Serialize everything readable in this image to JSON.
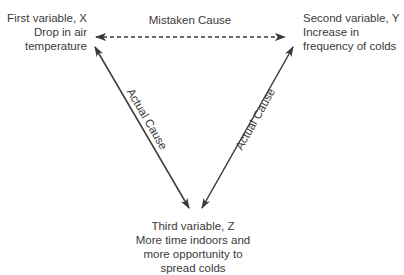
{
  "diagram": {
    "type": "causal-triangle",
    "nodes": {
      "x": {
        "title": "First variable, X",
        "lines": [
          "Drop in air",
          "temperature"
        ]
      },
      "y": {
        "title": "Second variable, Y",
        "lines": [
          "Increase in",
          "frequency of colds"
        ]
      },
      "z": {
        "title": "Third variable, Z",
        "lines": [
          "More time indoors and",
          "more opportunity to",
          "spread colds"
        ]
      }
    },
    "edges": [
      {
        "from": "x",
        "to": "y",
        "label": "Mistaken Cause",
        "style": "dashed",
        "direction": "both"
      },
      {
        "from": "x",
        "to": "z",
        "label": "Actual Cause",
        "style": "solid",
        "direction": "both"
      },
      {
        "from": "y",
        "to": "z",
        "label": "Actual Cause",
        "style": "solid",
        "direction": "both"
      }
    ],
    "colors": {
      "line": "#3a3a3a",
      "text": "#3a3a3a",
      "background": "#ffffff"
    }
  }
}
